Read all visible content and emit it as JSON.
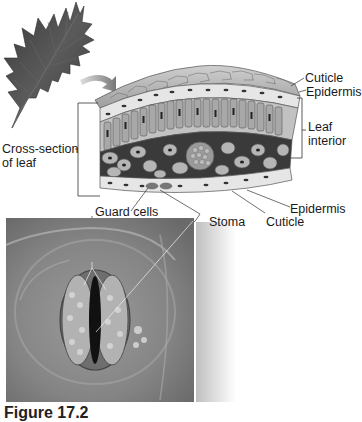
{
  "figure": {
    "caption": "Figure 17.2"
  },
  "illustrations": {
    "leaf": "oak-leaf-icon",
    "cross_section": "leaf-cross-section-illustration",
    "micrograph": "stoma-micrograph-photo",
    "arrow": "curved-arrow-icon"
  },
  "labels": {
    "cross_section_line1": "Cross-section",
    "cross_section_line2": "of leaf",
    "cuticle_top": "Cuticle",
    "epidermis_top": "Epidermis",
    "leaf_interior_line1": "Leaf",
    "leaf_interior_line2": "interior",
    "epidermis_bottom": "Epidermis",
    "cuticle_bottom": "Cuticle",
    "guard_cells": "Guard cells",
    "stoma": "Stoma"
  },
  "colors": {
    "background": "#ffffff",
    "leaf": "#4a4a4a",
    "cell_fill": "#b8b8b8",
    "cell_outline": "#555555",
    "photo_bg": "#8a8a8a",
    "text": "#1a1a1a"
  }
}
